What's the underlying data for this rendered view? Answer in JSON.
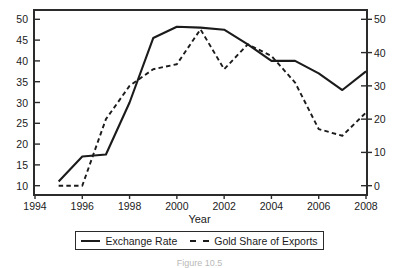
{
  "axis_title_x": "Year",
  "caption": "Figure 10.5",
  "legend": {
    "items": [
      {
        "label": "Exchange Rate",
        "style": "solid",
        "icon": "solid-line-icon"
      },
      {
        "label": "Gold Share of Exports",
        "style": "dashed",
        "icon": "dashed-line-icon"
      }
    ]
  },
  "chart_data": {
    "type": "line",
    "title": "",
    "xlabel": "Year",
    "ylabel": "Exchange Rate",
    "y2label": "Gold Share of Exports",
    "grid": false,
    "legend_position": "bottom",
    "xlim": [
      1994,
      2008
    ],
    "xticks": [
      "1994",
      "1996",
      "1998",
      "2000",
      "2002",
      "2004",
      "2006",
      "2008"
    ],
    "xtick_values": [
      1994,
      1996,
      1998,
      2000,
      2002,
      2004,
      2006,
      2008
    ],
    "ylim": [
      8,
      52
    ],
    "yticks": [
      "10",
      "15",
      "20",
      "25",
      "30",
      "35",
      "40",
      "45",
      "50"
    ],
    "ytick_values": [
      10,
      15,
      20,
      25,
      30,
      35,
      40,
      45,
      50
    ],
    "y2lim": [
      -2.5,
      52.5
    ],
    "y2ticks": [
      "0",
      "10",
      "20",
      "30",
      "40",
      "50"
    ],
    "y2tick_values": [
      0,
      10,
      20,
      30,
      40,
      50
    ],
    "series": [
      {
        "name": "Exchange Rate",
        "axis": "left",
        "style": "solid",
        "x": [
          1995,
          1996,
          1997,
          1998,
          1999,
          2000,
          2001,
          2002,
          2003,
          2004,
          2005,
          2006,
          2007,
          2008
        ],
        "values": [
          11,
          17,
          17.5,
          30,
          45.5,
          48.2,
          48,
          47.5,
          44,
          40,
          40,
          37,
          33,
          37.5
        ]
      },
      {
        "name": "Gold Share of Exports",
        "axis": "right",
        "style": "dashed",
        "x": [
          1995,
          1996,
          1997,
          1998,
          1999,
          2000,
          2001,
          2002,
          2003,
          2004,
          2005,
          2006,
          2007,
          2008
        ],
        "values": [
          0,
          0,
          20,
          30,
          35,
          36.5,
          47,
          35,
          42.5,
          39,
          31,
          17,
          15,
          22
        ]
      }
    ]
  }
}
